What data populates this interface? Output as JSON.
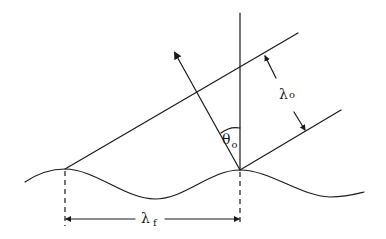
{
  "diagram": {
    "type": "wave-diffraction-geometry",
    "labels": {
      "lambda_o": {
        "symbol": "λ",
        "subscript": "o"
      },
      "lambda_f": {
        "symbol": "λ",
        "subscript": "f"
      },
      "theta_o": {
        "symbol": "θ",
        "subscript": "o"
      }
    },
    "elements": [
      "sinusoidal-surface",
      "vertical-normal-line",
      "incident-wavefront-upper",
      "incident-wavefront-lower",
      "propagation-arrow",
      "angle-arc-theta",
      "wavelength-dimension-lambda-o",
      "wavelength-dimension-lambda-f",
      "dashed-extension-lines"
    ]
  }
}
